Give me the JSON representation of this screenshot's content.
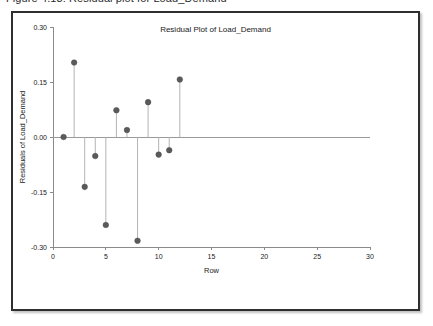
{
  "caption": {
    "text": "Figure 4.13: Residual plot for Load_Demand"
  },
  "figure": {
    "title": "Residual Plot of Load_Demand"
  },
  "chart_data": {
    "type": "scatter",
    "title": "Residual Plot of Load_Demand",
    "xlabel": "Row",
    "ylabel": "Residuals of Load_Demand",
    "xlim": [
      0,
      30
    ],
    "ylim": [
      -0.3,
      0.3
    ],
    "xticks": [
      0,
      5,
      10,
      15,
      20,
      25,
      30
    ],
    "xtick_labels": [
      "0",
      "5",
      "10",
      "15",
      "20",
      "25",
      "30"
    ],
    "yticks": [
      -0.3,
      -0.15,
      0.0,
      0.15,
      0.3
    ],
    "ytick_labels": [
      "-0.30",
      "-0.15",
      "0.00",
      "0.15",
      "0.30"
    ],
    "grid": false,
    "legend": false,
    "reference_line": 0.0,
    "marker_style": "filled-circle-with-stem",
    "marker_color": "#5a5a5a",
    "stem_color": "#b4b4b4",
    "x": [
      1,
      2,
      3,
      4,
      5,
      6,
      7,
      8,
      9,
      10,
      11,
      12
    ],
    "y": [
      0.0,
      0.203,
      -0.136,
      -0.052,
      -0.24,
      0.073,
      0.019,
      -0.283,
      0.095,
      -0.048,
      -0.036,
      0.157
    ],
    "series": [
      {
        "name": "Residuals of Load_Demand",
        "values": [
          0.0,
          0.203,
          -0.136,
          -0.052,
          -0.24,
          0.073,
          0.019,
          -0.283,
          0.095,
          -0.048,
          -0.036,
          0.157
        ]
      }
    ]
  }
}
